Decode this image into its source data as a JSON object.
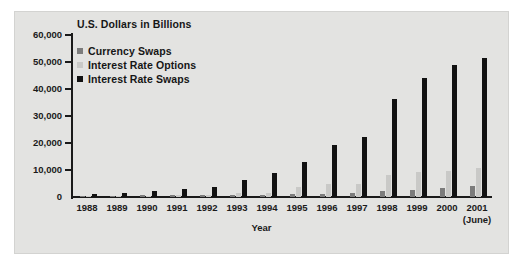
{
  "chart_data": {
    "type": "bar",
    "title": "U.S. Dollars in Billions",
    "xlabel": "Year",
    "ylabel": "",
    "categories": [
      "1988",
      "1989",
      "1990",
      "1991",
      "1992",
      "1993",
      "1994",
      "1995",
      "1996",
      "1997",
      "1998",
      "1999",
      "2000",
      "2001"
    ],
    "category_sublabels": [
      "",
      "",
      "",
      "",
      "",
      "",
      "",
      "",
      "",
      "",
      "",
      "",
      "",
      "(June)"
    ],
    "series": [
      {
        "name": "Currency Swaps",
        "color": "#7c7c7c",
        "values": [
          320,
          435,
          578,
          807,
          860,
          900,
          915,
          1197,
          1295,
          1585,
          2253,
          2444,
          3194,
          3942
        ]
      },
      {
        "name": "Interest Rate Options",
        "color": "#c9c9c7",
        "values": [
          327,
          537,
          561,
          577,
          634,
          1398,
          1573,
          3705,
          4723,
          4920,
          7997,
          9380,
          9476,
          10879
        ]
      },
      {
        "name": "Interest Rate Swaps",
        "color": "#121212",
        "values": [
          1010,
          1503,
          2312,
          3065,
          3851,
          6177,
          8816,
          12811,
          19171,
          22291,
          36262,
          43936,
          48768,
          51407
        ]
      }
    ],
    "ylim": [
      0,
      60000
    ],
    "yticks": [
      0,
      10000,
      20000,
      30000,
      40000,
      50000,
      60000
    ],
    "ytick_labels": [
      "0",
      "10,000",
      "20,000",
      "30,000",
      "40,000",
      "50,000",
      "60,000"
    ],
    "grid": false,
    "legend_position": "top-left"
  },
  "legend": {
    "items": [
      {
        "label": "Currency Swaps"
      },
      {
        "label": "Interest Rate Options"
      },
      {
        "label": "Interest Rate Swaps"
      }
    ]
  }
}
